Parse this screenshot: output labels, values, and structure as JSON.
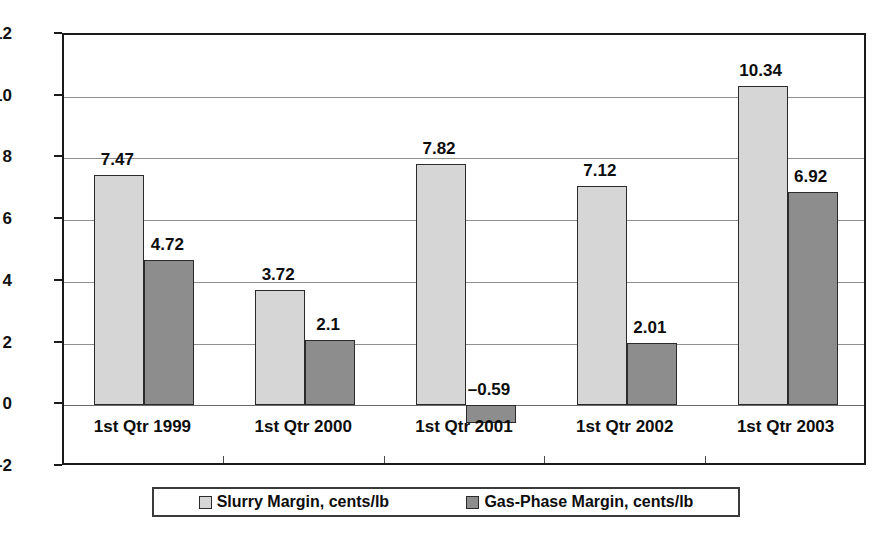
{
  "chart_data": {
    "type": "bar",
    "title": "",
    "subtitle": "",
    "xlabel": "",
    "ylabel": "",
    "categories": [
      "1st Qtr 1999",
      "1st Qtr 2000",
      "1st Qtr 2001",
      "1st Qtr 2002",
      "1st Qtr 2003"
    ],
    "series": [
      {
        "name": "Slurry Margin, cents/lb",
        "color": "#d6d6d6",
        "values": [
          7.47,
          3.72,
          7.82,
          7.12,
          10.34
        ],
        "labels": [
          "7.47",
          "3.72",
          "7.82",
          "7.12",
          "10.34"
        ]
      },
      {
        "name": "Gas-Phase Margin, cents/lb",
        "color": "#8d8d8d",
        "values": [
          4.72,
          2.1,
          -0.59,
          2.01,
          6.92
        ],
        "labels": [
          "4.72",
          "2.1",
          "–0.59",
          "2.01",
          "6.92"
        ]
      }
    ],
    "ylim": [
      -2,
      12
    ],
    "yticks": [
      -2,
      0,
      2,
      4,
      6,
      8,
      10,
      12
    ],
    "ytick_labels": [
      "–2",
      "0",
      "2",
      "4",
      "6",
      "8",
      "10",
      "12"
    ],
    "grid": true,
    "legend_position": "bottom"
  },
  "legend": {
    "items": [
      {
        "label": "Slurry Margin, cents/lb"
      },
      {
        "label": "Gas-Phase Margin, cents/lb"
      }
    ]
  }
}
